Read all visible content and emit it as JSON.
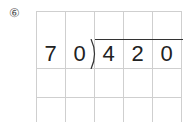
{
  "problem": {
    "number_label": "⑥",
    "divisor": [
      "7",
      "0"
    ],
    "dividend": [
      "4",
      "2",
      "0"
    ]
  },
  "grid": {
    "columns": 5,
    "rows": 4
  }
}
